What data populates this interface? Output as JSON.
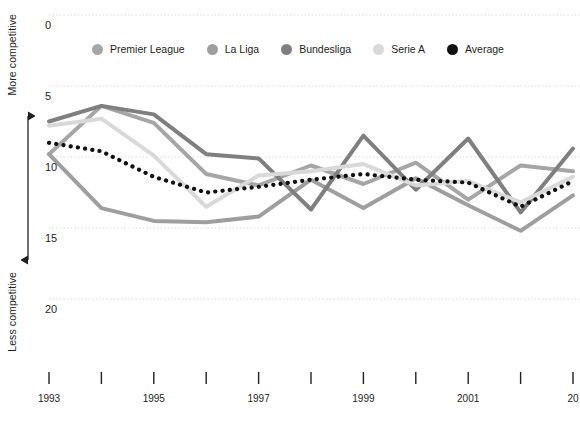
{
  "axis_titles": {
    "top": "More competitive",
    "bottom": "Less competitive"
  },
  "legend": {
    "items": [
      {
        "label": "Premier League",
        "color": "#a6a6a6",
        "icon": "legend-dot-icon"
      },
      {
        "label": "La Liga",
        "color": "#9e9e9e",
        "icon": "legend-dot-icon"
      },
      {
        "label": "Bundesliga",
        "color": "#7f7f7f",
        "icon": "legend-dot-icon"
      },
      {
        "label": "Serie A",
        "color": "#d9d9d9",
        "icon": "legend-dot-icon"
      },
      {
        "label": "Average",
        "color": "#111111",
        "icon": "legend-dot-icon"
      }
    ]
  },
  "chart_data": {
    "type": "line",
    "title": "",
    "xlabel": "",
    "ylabel": "",
    "ylim": [
      0,
      22.5
    ],
    "xlim": [
      1993,
      2003
    ],
    "y_inverted": true,
    "grid": true,
    "grid_axis": "y",
    "legend_position": "top",
    "y_ticks": [
      0,
      5,
      10,
      15,
      20
    ],
    "y_tick_labels": [
      "0",
      "5",
      "10",
      "15",
      "20"
    ],
    "x_ticks": [
      1993,
      1994,
      1995,
      1996,
      1997,
      1998,
      1999,
      2000,
      2001,
      2002,
      2003
    ],
    "x_tick_labels": [
      "1993",
      "",
      "1995",
      "",
      "1997",
      "",
      "1999",
      "",
      "2001",
      "",
      "20"
    ],
    "x": [
      1993,
      1994,
      1995,
      1996,
      1997,
      1998,
      1999,
      2000,
      2001,
      2002,
      2003
    ],
    "series": [
      {
        "name": "Premier League",
        "color": "#a6a6a6",
        "values": [
          9.8,
          6.4,
          7.6,
          11.2,
          12.0,
          10.6,
          11.9,
          10.4,
          13.0,
          10.6,
          11.0
        ]
      },
      {
        "name": "La Liga",
        "color": "#9e9e9e",
        "values": [
          9.8,
          13.6,
          14.5,
          14.6,
          14.2,
          11.6,
          13.6,
          11.5,
          13.4,
          15.2,
          12.7
        ]
      },
      {
        "name": "Bundesliga",
        "color": "#7f7f7f",
        "values": [
          7.5,
          6.4,
          7.0,
          9.8,
          10.1,
          13.7,
          8.5,
          12.3,
          8.7,
          13.9,
          9.4
        ]
      },
      {
        "name": "Serie A",
        "color": "#d9d9d9",
        "values": [
          7.8,
          7.3,
          9.9,
          13.5,
          11.3,
          11.0,
          10.5,
          12.0,
          11.7,
          13.2,
          11.4
        ]
      },
      {
        "name": "Average",
        "color": "#111111",
        "style": "dotted",
        "values": [
          9.0,
          9.6,
          11.4,
          12.5,
          12.1,
          11.6,
          11.2,
          11.6,
          11.8,
          13.5,
          11.7
        ]
      }
    ]
  }
}
